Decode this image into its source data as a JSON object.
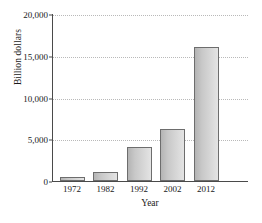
{
  "chart_data": {
    "type": "bar",
    "title": "",
    "subtitle": "",
    "xlabel": "Year",
    "ylabel": "Billion dollars",
    "categories": [
      "1972",
      "1982",
      "1992",
      "2002",
      "2012"
    ],
    "values": [
      450,
      1100,
      4100,
      6200,
      16000
    ],
    "series": [
      {
        "name": "Billion dollars",
        "values": [
          450,
          1100,
          4100,
          6200,
          16000
        ]
      }
    ],
    "ylim": [
      0,
      20000
    ],
    "yticks": [
      0,
      5000,
      10000,
      15000,
      20000
    ],
    "ytick_labels": [
      "0",
      "5,000",
      "10,000",
      "15,000",
      "20,000"
    ],
    "grid": true,
    "grid_axis": "y",
    "grid_style": "dotted",
    "legend": false,
    "legend_position": "none",
    "colors": {
      "bar_fill_dark": "#b4b4b4",
      "bar_fill_light": "#e4e4e4",
      "bar_border": "#6d6d6d",
      "axis": "#4a4a4a",
      "gridline": "#b9b9b9",
      "text": "#1a1a1a",
      "background": "#ffffff"
    }
  }
}
